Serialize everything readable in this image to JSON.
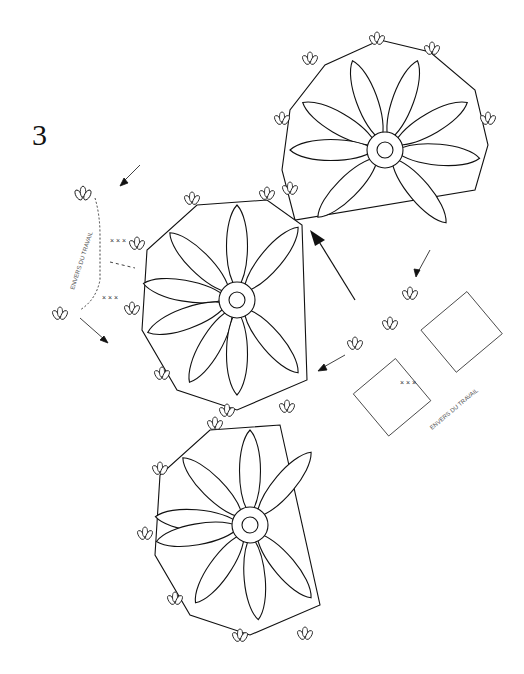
{
  "figure": {
    "number": "3",
    "label_left": "ENVERS DU TRAVAIL",
    "label_right": "ENVERS DU TRAVAIL",
    "stroke_color": "#111111",
    "background": "#ffffff"
  },
  "motifs": [
    {
      "name": "flower-top",
      "cx": 385,
      "cy": 150,
      "petals": 8
    },
    {
      "name": "flower-middle",
      "cx": 237,
      "cy": 300,
      "petals": 8
    },
    {
      "name": "flower-bottom",
      "cx": 250,
      "cy": 525,
      "petals": 8
    }
  ],
  "symbols": {
    "single_crochet": "×",
    "chain": "o"
  }
}
